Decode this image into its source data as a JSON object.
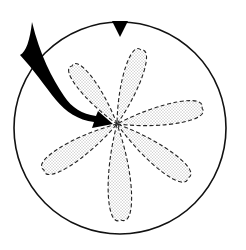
{
  "diagram": {
    "type": "rotational flower / lobe pattern",
    "circle": {
      "cx": 120,
      "cy": 128,
      "r": 106,
      "stroke": "#111111"
    },
    "top_marker": {
      "shape": "downward triangle",
      "color": "#000000"
    },
    "center": {
      "x": 117,
      "y": 124
    },
    "petals": [
      {
        "id": "upper-left",
        "tip": [
          72,
          66
        ]
      },
      {
        "id": "upper",
        "tip": [
          141,
          50
        ]
      },
      {
        "id": "right",
        "tip": [
          202,
          108
        ]
      },
      {
        "id": "lower-right",
        "tip": [
          188,
          178
        ]
      },
      {
        "id": "bottom",
        "tip": [
          121,
          220
        ]
      },
      {
        "id": "lower-left",
        "tip": [
          44,
          170
        ]
      }
    ],
    "petal_style": {
      "outline": "dashed",
      "fill": "stippled",
      "color": "#333333"
    },
    "arrow": {
      "shape": "curved black arrow",
      "direction": "into center",
      "color": "#000000"
    }
  }
}
